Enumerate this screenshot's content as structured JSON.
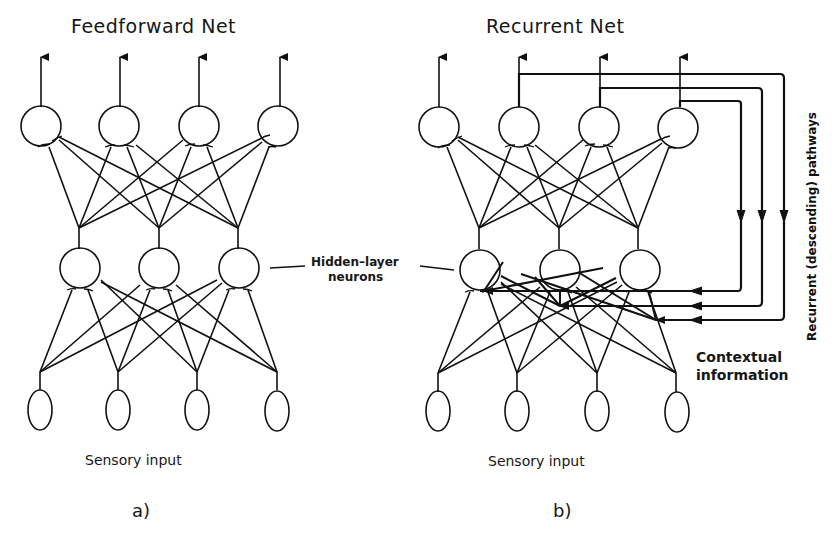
{
  "figure": {
    "panel_a": {
      "title": "Feedforward Net",
      "input_label": "Sensory input",
      "panel_label": "a)",
      "layers": {
        "output": 4,
        "hidden": 3,
        "input": 4
      }
    },
    "panel_b": {
      "title": "Recurrent Net",
      "input_label": "Sensory input",
      "panel_label": "b)",
      "layers": {
        "output": 4,
        "hidden": 3,
        "input": 4
      },
      "recurrent_label": "Recurrent (descending) pathways",
      "context_label_line1": "Contextual",
      "context_label_line2": "information"
    },
    "hidden_label_line1": "Hidden–layer",
    "hidden_label_line2": "neurons"
  }
}
